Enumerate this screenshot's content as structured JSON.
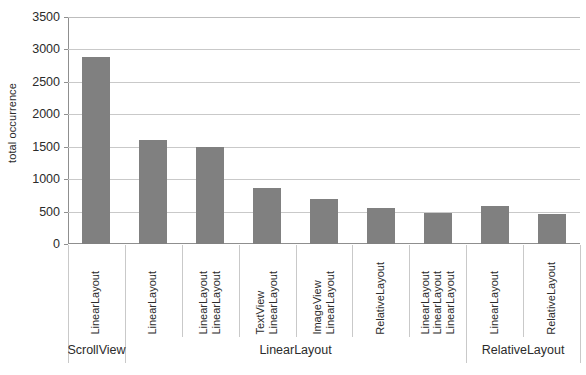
{
  "chart_data": {
    "type": "bar",
    "title": "",
    "subtitle": "",
    "xlabel": "",
    "ylabel": "total occurrence",
    "ylim": [
      0,
      3500
    ],
    "y_ticks": [
      0,
      500,
      1000,
      1500,
      2000,
      2500,
      3000,
      3500
    ],
    "y_tick_labels": [
      "0",
      "500",
      "1000",
      "1500",
      "2000",
      "2500",
      "3000",
      "3500"
    ],
    "grid": true,
    "legend": null,
    "bar_color": "#808080",
    "categories": [
      "LinearLayout",
      "LinearLayout",
      "LinearLayout\nLinearLayout",
      "TextView\nLinearLayout",
      "ImageView\nLinearLayout",
      "RelativeLayout",
      "LinearLayout\nLinearLayout\nLinearLayout",
      "LinearLayout",
      "RelativeLayout"
    ],
    "category_lines": [
      [
        "LinearLayout"
      ],
      [
        "LinearLayout"
      ],
      [
        "LinearLayout",
        "LinearLayout"
      ],
      [
        "TextView",
        "LinearLayout"
      ],
      [
        "ImageView",
        "LinearLayout"
      ],
      [
        "RelativeLayout"
      ],
      [
        "LinearLayout",
        "LinearLayout",
        "LinearLayout"
      ],
      [
        "LinearLayout"
      ],
      [
        "RelativeLayout"
      ]
    ],
    "values": [
      2880,
      1610,
      1500,
      870,
      700,
      550,
      480,
      580,
      460
    ],
    "groups": [
      {
        "label": "ScrollView",
        "start": 0,
        "end": 0
      },
      {
        "label": "LinearLayout",
        "start": 1,
        "end": 6
      },
      {
        "label": "RelativeLayout",
        "start": 7,
        "end": 8
      }
    ]
  }
}
